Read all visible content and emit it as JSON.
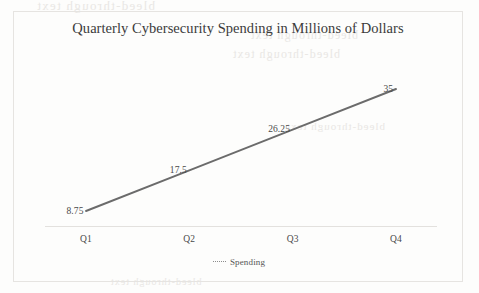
{
  "chart_data": {
    "type": "line",
    "title": "Quarterly Cybersecurity Spending in Millions of Dollars",
    "categories": [
      "Q1",
      "Q2",
      "Q3",
      "Q4"
    ],
    "series": [
      {
        "name": "Spending",
        "values": [
          8.75,
          17.5,
          26.25,
          35
        ],
        "labels": [
          "8.75",
          "17.5",
          "26.25",
          "35"
        ],
        "color": "#6b6b6b"
      }
    ],
    "xlabel": "",
    "ylabel": "",
    "ylim": [
      0,
      35
    ],
    "grid": false,
    "y_axis_visible": false,
    "x_axis_visible": true,
    "data_labels_shown": true,
    "markers_shown": false,
    "legend": {
      "position": "bottom",
      "entries": [
        "Spending"
      ]
    }
  },
  "axis": {
    "tick_labels": [
      "Q1",
      "Q2",
      "Q3",
      "Q4"
    ]
  },
  "legend": {
    "spending_label": "Spending"
  },
  "background_artifacts": {
    "ghost_1": "bleed-through text",
    "ghost_2": "bleed-through text",
    "ghost_3": "bleed-through text",
    "ghost_4": "bleed-through text",
    "ghost_5": "bleed-through text"
  }
}
